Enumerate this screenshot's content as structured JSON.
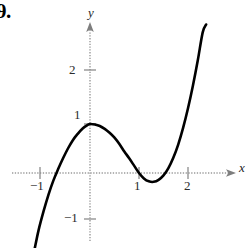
{
  "figure": {
    "problem_number": "9.",
    "background_color": "#ffffff",
    "curve_color": "#000000",
    "axis_color": "#8c8c8c",
    "width": 252,
    "height": 248
  },
  "chart_data": {
    "type": "line",
    "title": "",
    "subtitle": "",
    "xlabel": "x",
    "ylabel": "y",
    "xlim": [
      -1.6,
      3.0
    ],
    "ylim": [
      -1.6,
      3.1
    ],
    "grid": false,
    "legend": null,
    "x_ticks": [
      -1,
      1,
      2
    ],
    "x_tick_labels": [
      "−1",
      "1",
      "2"
    ],
    "y_ticks": [
      2,
      1,
      -1
    ],
    "y_tick_labels": [
      "2",
      "1",
      "−1"
    ],
    "origin_px": [
      90,
      173
    ],
    "unit_px": 49,
    "annotations": [],
    "series": [
      {
        "name": "curve",
        "description": "cubic-like curve with local maximum at (0, 1) and local minimum near (1.33, -0.18)",
        "features": {
          "local_maximum": [
            0,
            1
          ],
          "local_minimum": [
            1.33,
            -0.18
          ],
          "x_intercepts": [
            -0.75,
            1.0,
            1.58
          ]
        },
        "x": [
          -1.13,
          -1.05,
          -0.95,
          -0.85,
          -0.75,
          -0.65,
          -0.55,
          -0.45,
          -0.35,
          -0.25,
          -0.15,
          -0.05,
          0.0,
          0.1,
          0.2,
          0.3,
          0.4,
          0.5,
          0.6,
          0.7,
          0.8,
          0.9,
          1.0,
          1.1,
          1.2,
          1.3,
          1.4,
          1.5,
          1.6,
          1.7,
          1.8,
          1.9,
          2.0,
          2.1,
          2.2,
          2.3,
          2.37
        ],
        "y": [
          -1.55,
          -1.17,
          -0.79,
          -0.45,
          -0.16,
          0.08,
          0.3,
          0.5,
          0.67,
          0.8,
          0.91,
          0.98,
          1.0,
          0.99,
          0.96,
          0.9,
          0.82,
          0.72,
          0.59,
          0.44,
          0.3,
          0.15,
          0.0,
          -0.11,
          -0.17,
          -0.18,
          -0.14,
          -0.05,
          0.1,
          0.31,
          0.58,
          0.92,
          1.32,
          1.78,
          2.3,
          2.87,
          3.03
        ]
      }
    ]
  }
}
